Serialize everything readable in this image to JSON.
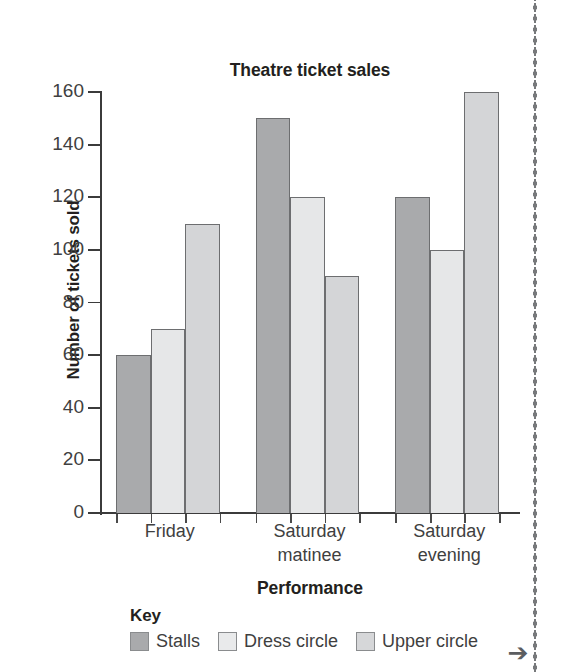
{
  "chart_data": {
    "type": "bar",
    "title": "Theatre ticket sales",
    "xlabel": "Performance",
    "ylabel": "Number of tickets sold",
    "categories": [
      "Friday",
      "Saturday matinee",
      "Saturday evening"
    ],
    "category_lines": [
      [
        "Friday"
      ],
      [
        "Saturday",
        "matinee"
      ],
      [
        "Saturday",
        "evening"
      ]
    ],
    "series": [
      {
        "name": "Stalls",
        "color": "#a9aaac",
        "values": [
          60,
          150,
          120
        ]
      },
      {
        "name": "Dress circle",
        "color": "#e6e7e8",
        "values": [
          70,
          120,
          100
        ]
      },
      {
        "name": "Upper circle",
        "color": "#d4d5d7",
        "values": [
          110,
          90,
          160
        ]
      }
    ],
    "ylim": [
      0,
      160
    ],
    "ytick_step": 20,
    "ytick_labels": [
      "160",
      "140",
      "120",
      "100",
      "80",
      "60",
      "40",
      "20",
      "0"
    ],
    "ytick_values": [
      160,
      140,
      120,
      100,
      80,
      60,
      40,
      20,
      0
    ],
    "grid": false,
    "legend_position": "below-chart",
    "legend_title": "Key"
  },
  "legend": {
    "title": "Key",
    "items": [
      {
        "label": "Stalls"
      },
      {
        "label": "Dress circle"
      },
      {
        "label": "Upper circle"
      }
    ]
  },
  "page": {
    "continue_arrow_glyph": "➔"
  }
}
